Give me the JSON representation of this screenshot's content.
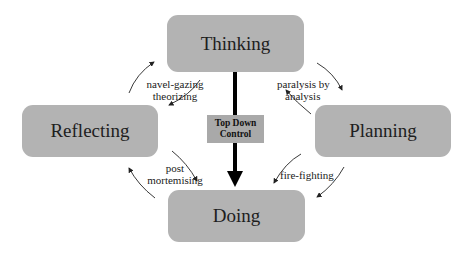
{
  "diagram": {
    "type": "cycle-with-control",
    "nodes": {
      "thinking": "Thinking",
      "reflecting": "Reflecting",
      "planning": "Planning",
      "doing": "Doing"
    },
    "control": {
      "line1": "Top Down",
      "line2": "Control"
    },
    "edge_labels": {
      "thinking_reflecting": {
        "line1": "navel-gazing",
        "line2": "theorizing"
      },
      "thinking_planning": {
        "line1": "paralysis by",
        "line2": "analysis"
      },
      "reflecting_doing": {
        "line1": "post",
        "line2": "mortemising"
      },
      "planning_doing": {
        "line1": "fire-fighting"
      }
    },
    "colors": {
      "node_fill": "#b3b3b3",
      "control_fill": "#a9a9a9",
      "arrow": "#222222",
      "background": "#ffffff"
    }
  }
}
